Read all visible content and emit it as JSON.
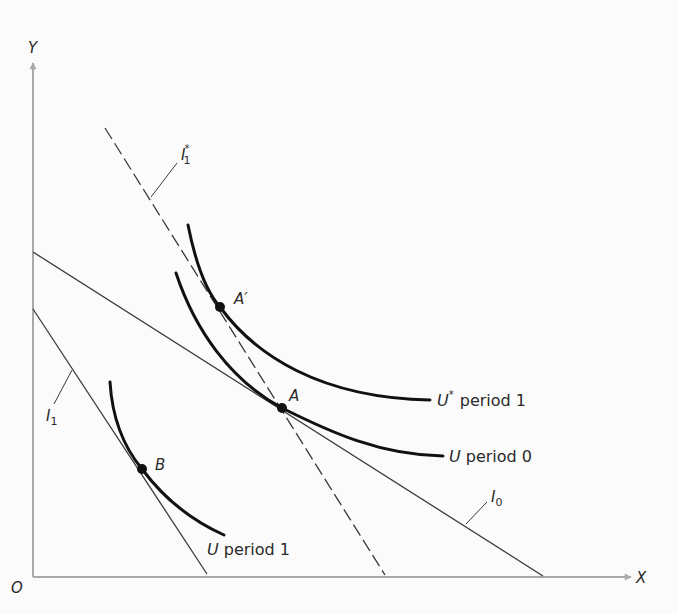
{
  "diagram": {
    "type": "indifference-curve / budget-line diagram",
    "axes": {
      "x_label": "X",
      "y_label": "Y",
      "origin_label": "O"
    },
    "budget_lines": [
      {
        "id": "I0",
        "label": "I",
        "subscript": "0",
        "superscript": "",
        "style": "solid"
      },
      {
        "id": "I1",
        "label": "I",
        "subscript": "1",
        "superscript": "",
        "style": "solid"
      },
      {
        "id": "I1star",
        "label": "I",
        "subscript": "1",
        "superscript": "*",
        "style": "dashed"
      }
    ],
    "indifference_curves": [
      {
        "id": "Ustar_p1",
        "symbol": "U",
        "superscript": "*",
        "text": "period 1"
      },
      {
        "id": "U_p0",
        "symbol": "U",
        "superscript": "",
        "text": "period 0"
      },
      {
        "id": "U_p1",
        "symbol": "U",
        "superscript": "",
        "text": "period 1"
      }
    ],
    "points": [
      {
        "id": "A",
        "label": "A"
      },
      {
        "id": "Aprime",
        "label": "A′"
      },
      {
        "id": "B",
        "label": "B"
      }
    ],
    "colors": {
      "axis": "#a9a9a9",
      "line": "#3a3a3a",
      "curve": "#111111",
      "text": "#2a2a2a",
      "background": "#fbfbfb"
    }
  }
}
